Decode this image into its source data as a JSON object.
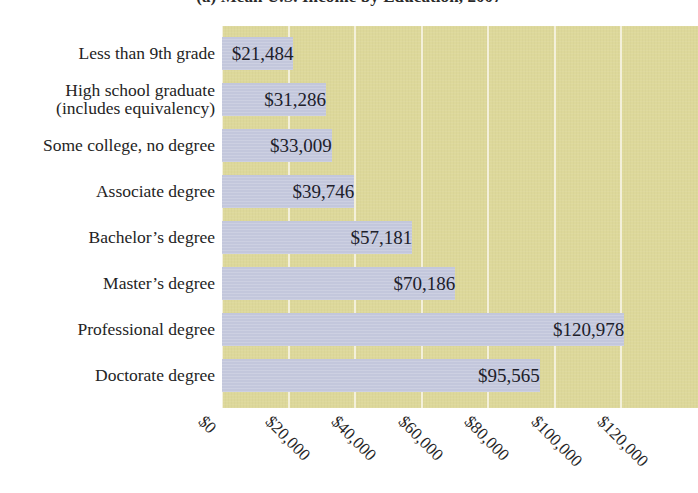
{
  "chart_data": {
    "type": "bar",
    "orientation": "horizontal",
    "title": "(a)  Mean U.S. Income by Education, 2007",
    "title_prefix": "(a)",
    "title_main": "Mean U.S. Income by Education, 2007",
    "xlabel": "",
    "ylabel": "",
    "xlim": [
      0,
      143000
    ],
    "xticks": [
      0,
      20000,
      40000,
      60000,
      80000,
      100000,
      120000
    ],
    "xtick_labels": [
      "$0",
      "$20,000",
      "$40,000",
      "$60,000",
      "$80,000",
      "$100,000",
      "$120,000"
    ],
    "grid": true,
    "grid_axis": "x",
    "legend": null,
    "categories": [
      "Less than 9th grade",
      "High school graduate (includes equivalency)",
      "Some college, no degree",
      "Associate degree",
      "Bachelor's degree",
      "Master's degree",
      "Professional degree",
      "Doctorate degree"
    ],
    "values": [
      21484,
      31286,
      33009,
      39746,
      57181,
      70186,
      120978,
      95565
    ],
    "value_labels": [
      "$21,484",
      "$31,286",
      "$33,009",
      "$39,746",
      "$57,181",
      "$70,186",
      "$120,978",
      "$95,565"
    ],
    "colors": {
      "bar": "#c3c7dc",
      "plot_background": "#ddd89a",
      "gridline": "#f4f1dd",
      "page_background": "#ffffff",
      "text": "#242424"
    }
  },
  "axis": {
    "categories": [
      {
        "line1": "Less than 9th grade",
        "line2": ""
      },
      {
        "line1": "High school graduate",
        "line2": "(includes equivalency)"
      },
      {
        "line1": "Some college, no degree",
        "line2": ""
      },
      {
        "line1": "Associate degree",
        "line2": ""
      },
      {
        "line1": "Bachelor’s degree",
        "line2": ""
      },
      {
        "line1": "Master’s degree",
        "line2": ""
      },
      {
        "line1": "Professional degree",
        "line2": ""
      },
      {
        "line1": "Doctorate degree",
        "line2": ""
      }
    ]
  }
}
